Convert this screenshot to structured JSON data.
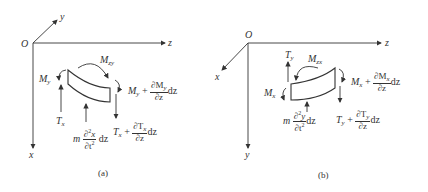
{
  "panels": [
    {
      "id": "a",
      "caption": "(a)",
      "origin": "O",
      "axes": {
        "horizontal": "z",
        "diagonal": "y",
        "vertical": "x"
      },
      "labels": {
        "moment_left": "M",
        "moment_left_sub": "y",
        "moment_top": "M",
        "moment_top_sub": "zy",
        "moment_right": "M",
        "moment_right_sub": "y",
        "plus": "+",
        "moment_right_num": "∂M",
        "moment_right_num_sub": "y",
        "moment_right_den": "∂z",
        "dz": "dz",
        "shear_left": "T",
        "shear_left_sub": "x",
        "shear_right": "T",
        "shear_right_sub": "x",
        "shear_right_num": "∂T",
        "shear_right_num_sub": "x",
        "shear_right_den": "∂z",
        "inertia_m": "m",
        "inertia_num": "∂",
        "inertia_num_sup": "2",
        "inertia_num_var": "x",
        "inertia_den": "∂t",
        "inertia_den_sup": "2"
      }
    },
    {
      "id": "b",
      "caption": "(b)",
      "origin": "O",
      "axes": {
        "horizontal": "z",
        "diagonal": "x",
        "vertical": "y"
      },
      "labels": {
        "moment_left": "M",
        "moment_left_sub": "x",
        "moment_top": "M",
        "moment_top_sub": "zx",
        "moment_right": "M",
        "moment_right_sub": "x",
        "plus": "+",
        "moment_right_num": "∂M",
        "moment_right_num_sub": "x",
        "moment_right_den": "∂z",
        "dz": "dz",
        "shear_left": "T",
        "shear_left_sub": "y",
        "shear_right": "T",
        "shear_right_sub": "y",
        "shear_right_num": "∂T",
        "shear_right_num_sub": "y",
        "shear_right_den": "∂z",
        "inertia_m": "m",
        "inertia_num": "∂",
        "inertia_num_sup": "2",
        "inertia_num_var": "y",
        "inertia_den": "∂t",
        "inertia_den_sup": "2"
      }
    }
  ]
}
